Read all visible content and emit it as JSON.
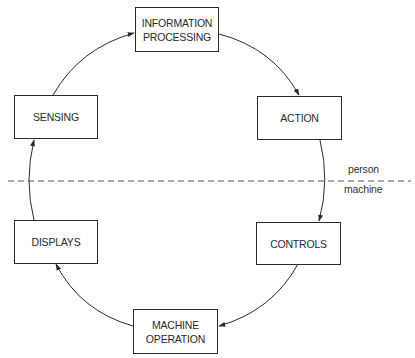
{
  "diagram": {
    "type": "cycle",
    "nodes": [
      {
        "id": "information-processing",
        "label": "INFORMATION\nPROCESSING",
        "zone": "person"
      },
      {
        "id": "action",
        "label": "ACTION",
        "zone": "person"
      },
      {
        "id": "controls",
        "label": "CONTROLS",
        "zone": "machine"
      },
      {
        "id": "machine-operation",
        "label": "MACHINE\nOPERATION",
        "zone": "machine"
      },
      {
        "id": "displays",
        "label": "DISPLAYS",
        "zone": "machine"
      },
      {
        "id": "sensing",
        "label": "SENSING",
        "zone": "person"
      }
    ],
    "edges": [
      {
        "from": "sensing",
        "to": "information-processing"
      },
      {
        "from": "information-processing",
        "to": "action"
      },
      {
        "from": "action",
        "to": "controls"
      },
      {
        "from": "controls",
        "to": "machine-operation"
      },
      {
        "from": "machine-operation",
        "to": "displays"
      },
      {
        "from": "displays",
        "to": "sensing"
      }
    ],
    "divider": {
      "style": "dashed",
      "upper_label": "person",
      "lower_label": "machine"
    },
    "colors": {
      "stroke": "#2a2a2a",
      "divider": "#555555",
      "background": "#ffffff"
    }
  }
}
